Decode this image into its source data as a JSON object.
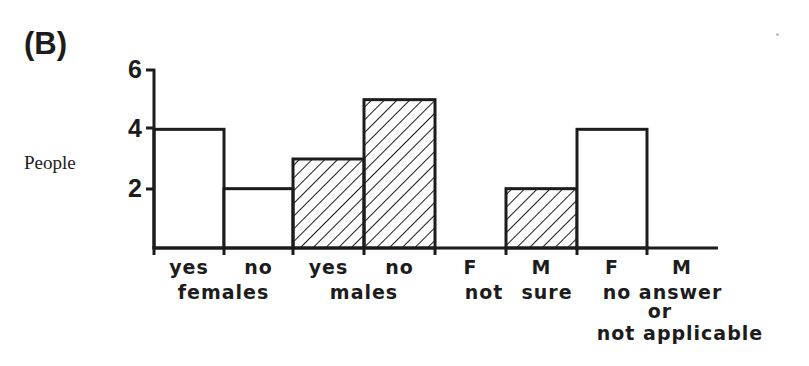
{
  "panel_label": "(B)",
  "chart_data": {
    "type": "bar",
    "title": "(B)",
    "xlabel": "",
    "ylabel": "People",
    "ylim": [
      0,
      6
    ],
    "yticks": [
      2,
      4,
      6
    ],
    "grid": false,
    "legend": null,
    "categories": [
      "yes",
      "no",
      "yes",
      "no",
      "F",
      "M",
      "F",
      "M"
    ],
    "groups": [
      {
        "label": "females",
        "categories": [
          "yes",
          "no"
        ]
      },
      {
        "label": "males",
        "categories": [
          "yes",
          "no"
        ]
      },
      {
        "label": "not sure",
        "categories": [
          "F",
          "M"
        ]
      },
      {
        "label": "no answer or not applicable",
        "categories": [
          "F",
          "M"
        ]
      }
    ],
    "values": [
      4,
      2,
      3,
      5,
      0,
      2,
      4,
      0
    ],
    "hatched": [
      false,
      false,
      true,
      true,
      false,
      true,
      false,
      false
    ],
    "series": [
      {
        "name": "female (open bars)",
        "values": [
          4,
          2,
          null,
          null,
          0,
          null,
          4,
          null
        ]
      },
      {
        "name": "male (hatched bars)",
        "values": [
          null,
          null,
          3,
          5,
          null,
          2,
          null,
          0
        ]
      }
    ]
  },
  "axis": {
    "ylabel": "People",
    "yticks": [
      "2",
      "4",
      "6"
    ]
  },
  "xlabels": {
    "row1": [
      "yes",
      "no",
      "yes",
      "no",
      "F",
      "M",
      "F",
      "M"
    ],
    "group_females": "females",
    "group_males": "males",
    "group_notsure_left": "not",
    "group_notsure_right": "sure",
    "group_noanswer_line1": "no answer",
    "group_noanswer_line2": "or",
    "group_noanswer_line3": "not applicable"
  }
}
